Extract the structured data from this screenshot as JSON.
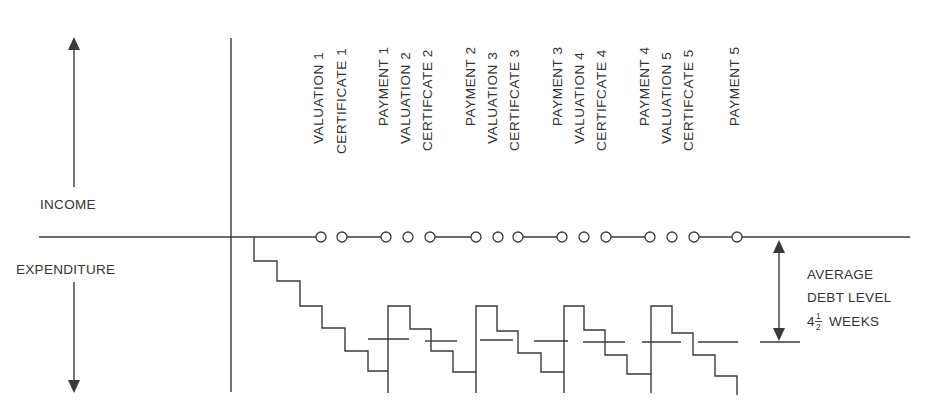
{
  "axis_labels": {
    "income": "INCOME",
    "expenditure": "EXPENDITURE"
  },
  "event_labels": [
    {
      "text": "VALUATION 1",
      "x": 318
    },
    {
      "text": "CERTIFICATE 1",
      "x": 341
    },
    {
      "text": "PAYMENT 1",
      "x": 384
    },
    {
      "text": "VALUATION 2",
      "x": 405
    },
    {
      "text": "CERTIFCATE 2",
      "x": 427
    },
    {
      "text": "PAYMENT 2",
      "x": 470
    },
    {
      "text": "VALUATION 3",
      "x": 492
    },
    {
      "text": "CERTIFCATE 3",
      "x": 514
    },
    {
      "text": "PAYMENT 3",
      "x": 557
    },
    {
      "text": "VALUATION 4",
      "x": 579
    },
    {
      "text": "CERTIFCATE 4",
      "x": 601
    },
    {
      "text": "PAYMENT 4",
      "x": 644
    },
    {
      "text": "VALUATION 5",
      "x": 666
    },
    {
      "text": "CERTIFCATE 5",
      "x": 688
    },
    {
      "text": "PAYMENT 5",
      "x": 734
    }
  ],
  "annotation": {
    "line1": "AVERAGE",
    "line2": "DEBT LEVEL",
    "line3_whole": "4",
    "line3_num": "1",
    "line3_den": "2",
    "line3_unit": "WEEKS"
  },
  "circle_markers_x": [
    321,
    342,
    386,
    408,
    430,
    476,
    498,
    518,
    562,
    584,
    606,
    650,
    672,
    694,
    737
  ],
  "stepped_expenditure": {
    "description": "Cumulative expenditure falling weekly, partially restored at each payment",
    "average_debt_level": "4 1/2 weeks"
  }
}
